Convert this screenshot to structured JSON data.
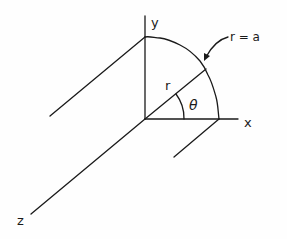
{
  "diagram": {
    "type": "coordinate-geometry",
    "labels": {
      "y_axis": "y",
      "x_axis": "x",
      "z_axis": "z",
      "radius": "r",
      "angle": "θ",
      "boundary": "r = a"
    },
    "colors": {
      "stroke": "#1a1a1a",
      "background": "#fefefe"
    }
  }
}
